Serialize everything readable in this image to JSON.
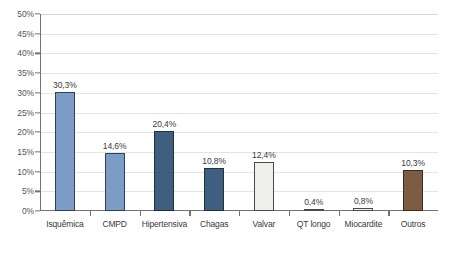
{
  "chart_data": {
    "type": "bar",
    "title": "",
    "subtitle": "",
    "xlabel": "",
    "ylabel": "",
    "ylim": [
      0,
      50
    ],
    "ytick_step": 5,
    "grid": true,
    "legend": false,
    "decimal_separator": ",",
    "value_suffix": "%",
    "categories": [
      "Isquêmica",
      "CMPD",
      "Hipertensiva",
      "Chagas",
      "Valvar",
      "QT longo",
      "Miocardite",
      "Outros"
    ],
    "values": [
      30.3,
      14.6,
      20.4,
      10.8,
      12.4,
      0.4,
      0.8,
      10.3
    ],
    "value_labels": [
      "30,3%",
      "14,6%",
      "20,4%",
      "10,8%",
      "12,4%",
      "0,4%",
      "0,8%",
      "10,3%"
    ],
    "bar_colors": [
      "#7c9cc6",
      "#7c9cc6",
      "#3f5f80",
      "#3f5f80",
      "#eeeeea",
      "#f2f2ee",
      "#f2f2ee",
      "#7d5c42"
    ],
    "bar_border_colors": [
      "#2f3f55",
      "#2f3f55",
      "#22313f",
      "#22313f",
      "#4a4a4a",
      "#4a4a4a",
      "#4a4a4a",
      "#3d2d20"
    ],
    "ytick_labels": [
      "0%",
      "5%",
      "10%",
      "15%",
      "20%",
      "25%",
      "30%",
      "35%",
      "40%",
      "45%",
      "50%"
    ],
    "ytick_values": [
      0,
      5,
      10,
      15,
      20,
      25,
      30,
      35,
      40,
      45,
      50
    ]
  },
  "axes": {
    "axis_line_color": "#737373",
    "gridline_color": "#e4e4e4",
    "background_color": "#ffffff"
  }
}
